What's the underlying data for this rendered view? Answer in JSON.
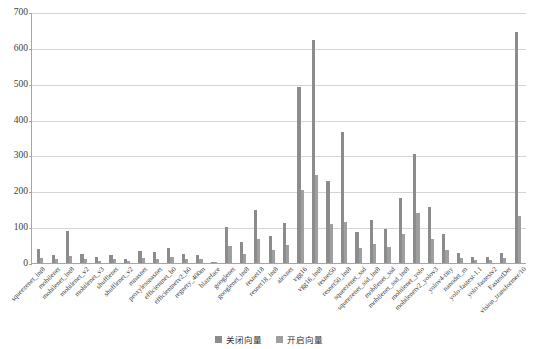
{
  "chart_data": {
    "type": "bar",
    "title": "",
    "xlabel": "",
    "ylabel": "",
    "ylim": [
      0,
      700
    ],
    "yticks": [
      0,
      100,
      200,
      300,
      400,
      500,
      600,
      700
    ],
    "grid": true,
    "legend_position": "bottom",
    "colors": {
      "closed": "#8c8c8c",
      "open": "#9f9f9f",
      "gridline": "#d4d4d4",
      "axis": "#a6a6a6",
      "background": "#ffffff"
    },
    "categories": [
      "squeezenet_int8",
      "mobilenet",
      "mobilenet_int8",
      "mobilenet_v2",
      "mobilenet_v3",
      "shufflenet",
      "shufflenet_v2",
      "mnasnet",
      "proxylessnasnet",
      "efficientnet_b0",
      "efficientnetv2_b0",
      "regnety_400m",
      "blazeface",
      "googlenet",
      "googlenet_int8",
      "resnet18",
      "resnet18_int8",
      "alexnet",
      "vgg16",
      "vgg16_int8",
      "resnet50",
      "resnet50_int8",
      "squeezenet_ssd",
      "squeezenet_ssd_int8",
      "mobilenet_ssd",
      "mobilenet_ssd_int8",
      "mobilenet_yolo",
      "mobilenetv2_yolov3",
      "yolov4-tiny",
      "nanodet_m",
      "yolo-fastest-1.1",
      "yolo-fastestv2",
      "FastestDet",
      "vision_transformer/10"
    ],
    "series": [
      {
        "name": "关闭向量",
        "values": [
          40,
          23,
          89,
          26,
          18,
          23,
          11,
          34,
          31,
          43,
          25,
          21,
          4,
          101,
          60,
          148,
          75,
          111,
          490,
          622,
          230,
          365,
          86,
          119,
          94,
          182,
          305,
          156,
          81,
          27,
          18,
          16,
          28,
          645
        ]
      },
      {
        "name": "开启向量",
        "values": [
          14,
          11,
          19,
          10,
          7,
          10,
          6,
          13,
          12,
          17,
          12,
          10,
          2,
          47,
          26,
          66,
          35,
          51,
          205,
          245,
          110,
          114,
          41,
          53,
          45,
          82,
          140,
          66,
          36,
          13,
          9,
          8,
          14,
          131
        ]
      }
    ]
  },
  "legend": {
    "items": [
      {
        "label": "关闭向量"
      },
      {
        "label": "开启向量"
      }
    ]
  }
}
